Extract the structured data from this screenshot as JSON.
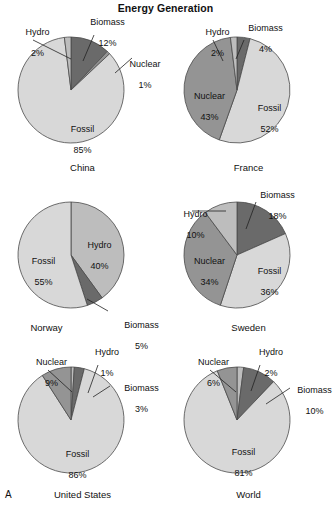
{
  "figure": {
    "title": "Energy Generation",
    "panel_letter": "A",
    "colors": {
      "fossil": "#d8d8d8",
      "nuclear": "#949494",
      "hydro": "#bdbdbd",
      "biomass": "#6a6a6a",
      "outline": "#4a4a4a",
      "text": "#111111",
      "background": "#ffffff"
    }
  },
  "chart_data": {
    "type": "pie",
    "title": "Energy Generation",
    "units": "percent",
    "categories": [
      "Fossil",
      "Nuclear",
      "Hydro",
      "Biomass"
    ],
    "charts": [
      {
        "title": "China",
        "slices": [
          {
            "label": "Biomass",
            "value": 12,
            "value_text": "12%"
          },
          {
            "label": "Nuclear",
            "value": 1,
            "value_text": "1%"
          },
          {
            "label": "Fossil",
            "value": 85,
            "value_text": "85%"
          },
          {
            "label": "Hydro",
            "value": 2,
            "value_text": "2%"
          }
        ]
      },
      {
        "title": "France",
        "slices": [
          {
            "label": "Biomass",
            "value": 4,
            "value_text": "4%"
          },
          {
            "label": "Fossil",
            "value": 52,
            "value_text": "52%"
          },
          {
            "label": "Nuclear",
            "value": 43,
            "value_text": "43%"
          },
          {
            "label": "Hydro",
            "value": 2,
            "value_text": "2%"
          }
        ]
      },
      {
        "title": "Norway",
        "slices": [
          {
            "label": "Hydro",
            "value": 40,
            "value_text": "40%"
          },
          {
            "label": "Biomass",
            "value": 5,
            "value_text": "5%"
          },
          {
            "label": "Fossil",
            "value": 55,
            "value_text": "55%"
          }
        ]
      },
      {
        "title": "Sweden",
        "slices": [
          {
            "label": "Biomass",
            "value": 18,
            "value_text": "18%"
          },
          {
            "label": "Fossil",
            "value": 36,
            "value_text": "36%"
          },
          {
            "label": "Nuclear",
            "value": 34,
            "value_text": "34%"
          },
          {
            "label": "Hydro",
            "value": 10,
            "value_text": "10%"
          }
        ]
      },
      {
        "title": "United States",
        "slices": [
          {
            "label": "Hydro",
            "value": 1,
            "value_text": "1%"
          },
          {
            "label": "Biomass",
            "value": 3,
            "value_text": "3%"
          },
          {
            "label": "Fossil",
            "value": 86,
            "value_text": "86%"
          },
          {
            "label": "Nuclear",
            "value": 9,
            "value_text": "9%"
          }
        ]
      },
      {
        "title": "World",
        "slices": [
          {
            "label": "Hydro",
            "value": 2,
            "value_text": "2%"
          },
          {
            "label": "Biomass",
            "value": 10,
            "value_text": "10%"
          },
          {
            "label": "Fossil",
            "value": 81,
            "value_text": "81%"
          },
          {
            "label": "Nuclear",
            "value": 6,
            "value_text": "6%"
          }
        ]
      }
    ]
  },
  "panels": {
    "china": {
      "country": "China",
      "labels": {
        "hydro_name": "Hydro",
        "hydro_pct": "2%",
        "biomass_name": "Biomass",
        "biomass_pct": "12%",
        "nuclear_name": "Nuclear",
        "nuclear_pct": "1%",
        "fossil_name": "Fossil",
        "fossil_pct": "85%"
      }
    },
    "france": {
      "country": "France",
      "labels": {
        "hydro_name": "Hydro",
        "hydro_pct": "2%",
        "biomass_name": "Biomass",
        "biomass_pct": "4%",
        "nuclear_name": "Nuclear",
        "nuclear_pct": "43%",
        "fossil_name": "Fossil",
        "fossil_pct": "52%"
      }
    },
    "norway": {
      "country": "Norway",
      "labels": {
        "hydro_name": "Hydro",
        "hydro_pct": "40%",
        "biomass_name": "Biomass",
        "biomass_pct": "5%",
        "fossil_name": "Fossil",
        "fossil_pct": "55%"
      }
    },
    "sweden": {
      "country": "Sweden",
      "labels": {
        "hydro_name": "Hydro",
        "hydro_pct": "10%",
        "biomass_name": "Biomass",
        "biomass_pct": "18%",
        "nuclear_name": "Nuclear",
        "nuclear_pct": "34%",
        "fossil_name": "Fossil",
        "fossil_pct": "36%"
      }
    },
    "united_states": {
      "country": "United States",
      "labels": {
        "hydro_name": "Hydro",
        "hydro_pct": "1%",
        "biomass_name": "Biomass",
        "biomass_pct": "3%",
        "nuclear_name": "Nuclear",
        "nuclear_pct": "9%",
        "fossil_name": "Fossil",
        "fossil_pct": "86%"
      }
    },
    "world": {
      "country": "World",
      "labels": {
        "hydro_name": "Hydro",
        "hydro_pct": "2%",
        "biomass_name": "Biomass",
        "biomass_pct": "10%",
        "nuclear_name": "Nuclear",
        "nuclear_pct": "6%",
        "fossil_name": "Fossil",
        "fossil_pct": "81%"
      }
    }
  }
}
